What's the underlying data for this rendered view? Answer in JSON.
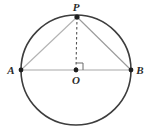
{
  "figure": {
    "kind": "circle-geometry-diagram",
    "background_color": "#ffffff",
    "canvas": {
      "width": 153,
      "height": 135
    }
  },
  "circle": {
    "name": "main-circle",
    "center_x": 76,
    "center_y": 70,
    "radius": 55,
    "stroke_color": "#3d3d3d",
    "stroke_width": 1.6,
    "fill": "none"
  },
  "points": [
    {
      "id": "A",
      "label": "A",
      "x": 21,
      "y": 70,
      "label_x": 11,
      "label_y": 74,
      "dot_radius": 2.4,
      "color": "#1f1f1f"
    },
    {
      "id": "B",
      "label": "B",
      "x": 131,
      "y": 70,
      "label_x": 136,
      "label_y": 74,
      "dot_radius": 2.4,
      "color": "#1f1f1f"
    },
    {
      "id": "P",
      "label": "P",
      "x": 77,
      "y": 17,
      "label_x": 72,
      "label_y": 11,
      "dot_radius": 2.6,
      "color": "#1f1f1f"
    },
    {
      "id": "O",
      "label": "O",
      "x": 76,
      "y": 70,
      "label_x": 72,
      "label_y": 84,
      "dot_radius": 2.4,
      "color": "#1f1f1f"
    }
  ],
  "segments": [
    {
      "id": "AB",
      "from": "A",
      "to": "B",
      "x1": 21,
      "y1": 70,
      "x2": 131,
      "y2": 70,
      "stroke_color": "#a8a8a8",
      "stroke_width": 1.1,
      "style": "solid"
    },
    {
      "id": "AP",
      "from": "A",
      "to": "P",
      "x1": 21,
      "y1": 70,
      "x2": 77,
      "y2": 17,
      "stroke_color": "#b2b2b2",
      "stroke_width": 1.1,
      "style": "solid"
    },
    {
      "id": "PB",
      "from": "P",
      "to": "B",
      "x1": 77,
      "y1": 17,
      "x2": 131,
      "y2": 70,
      "stroke_color": "#9a9a9a",
      "stroke_width": 1.1,
      "style": "solid"
    },
    {
      "id": "PO",
      "from": "P",
      "to": "O",
      "x1": 77,
      "y1": 17,
      "x2": 76,
      "y2": 70,
      "stroke_color": "#555555",
      "stroke_width": 1.1,
      "style": "dashed",
      "dash_pattern": "2.5,2.5"
    }
  ],
  "right_angle_marker": {
    "id": "angle-POB",
    "at_point": "O",
    "size": 7,
    "stroke_color": "#6a6a6a",
    "stroke_width": 1.0,
    "path": "M 76 63 L 83 63 L 83 70"
  },
  "labels": {
    "A": "A",
    "B": "B",
    "P": "P",
    "O": "O"
  }
}
